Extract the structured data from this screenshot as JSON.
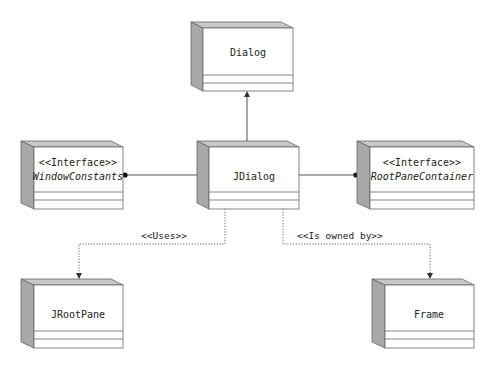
{
  "diagram": {
    "type": "UML class diagram",
    "colors": {
      "side": "#a8a8a8",
      "top": "#c8c8c8",
      "line": "#555555",
      "front": "#ffffff"
    },
    "classes": [
      {
        "id": "dialog",
        "stereotype": "",
        "name": "Dialog",
        "italic": false
      },
      {
        "id": "jdialog",
        "stereotype": "",
        "name": "JDialog",
        "italic": false
      },
      {
        "id": "windowconstants",
        "stereotype": "<<Interface>>",
        "name": "WindowConstants",
        "italic": true
      },
      {
        "id": "rootpanecontainer",
        "stereotype": "<<Interface>>",
        "name": "RootPaneContainer",
        "italic": true
      },
      {
        "id": "jrootpane",
        "stereotype": "",
        "name": "JRootPane",
        "italic": false
      },
      {
        "id": "frame",
        "stereotype": "",
        "name": "Frame",
        "italic": false
      }
    ],
    "relationships": [
      {
        "from": "JDialog",
        "to": "Dialog",
        "kind": "generalization",
        "label": ""
      },
      {
        "from": "JDialog",
        "to": "WindowConstants",
        "kind": "realization-lollipop",
        "label": ""
      },
      {
        "from": "JDialog",
        "to": "RootPaneContainer",
        "kind": "realization-lollipop",
        "label": ""
      },
      {
        "from": "JDialog",
        "to": "JRootPane",
        "kind": "dependency",
        "label": "<<Uses>>"
      },
      {
        "from": "JDialog",
        "to": "Frame",
        "kind": "dependency",
        "label": "<<Is owned by>>"
      }
    ]
  }
}
